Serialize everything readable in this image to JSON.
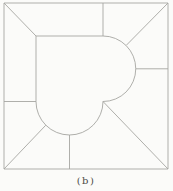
{
  "figure": {
    "caption": "(b)",
    "colors": {
      "background": "#fbfbf9",
      "line": "#a6a6a2",
      "caption_text": "#4b4b46"
    },
    "paths": {
      "outer_square": "M 4 3 L 168 3 L 168 169 L 4 169 Z",
      "heart_outline": "M 36 36 L 103 36 A 32.75 32.75 0 0 1 103 101.5 A 33.5 33.5 0 0 1 36 101.5 L 36 36 Z",
      "divider_top_left_diagonal": "M 4 3 L 36 36",
      "divider_top_vertical": "M 103 3 L 103 36",
      "divider_top_right_diagonal": "M 168 3 L 126.2 45.4",
      "divider_right_horizontal": "M 135.8 68.8 L 168 68.8",
      "divider_bottom_right_diagonal": "M 103 101.5 L 168 169",
      "divider_bottom_vertical": "M 69.5 135 L 69.5 169",
      "divider_bottom_left_diagonal": "M 4 169 L 45.8 125.2",
      "divider_left_horizontal": "M 4 101.5 L 36 101.5"
    }
  }
}
